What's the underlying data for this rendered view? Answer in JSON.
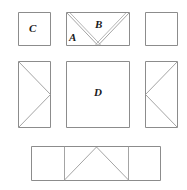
{
  "figure": {
    "type": "geometric-dissection-diagram",
    "background_color": "#ffffff",
    "stroke_color": "#8c8c8c",
    "label_color": "#1a1a1a",
    "labels": [
      {
        "id": "label-a",
        "text": "A",
        "x": 69,
        "y": 32
      },
      {
        "id": "label-b",
        "text": "B",
        "x": 95,
        "y": 19
      },
      {
        "id": "label-c",
        "text": "C",
        "x": 29,
        "y": 23
      },
      {
        "id": "label-d",
        "text": "D",
        "x": 94,
        "y": 87
      }
    ],
    "pieces": [
      {
        "name": "top-left-square",
        "label": "C",
        "x": 18,
        "y": 12,
        "width": 33,
        "height": 34,
        "interior_lines": "none"
      },
      {
        "name": "top-middle-rectangle",
        "labels": [
          "A",
          "B"
        ],
        "x": 66,
        "y": 12,
        "width": 64,
        "height": 34,
        "interior_lines": "double-chevron-v-from-top-corners-to-bottom-center"
      },
      {
        "name": "top-right-square",
        "label": "",
        "x": 145,
        "y": 12,
        "width": 33,
        "height": 34,
        "interior_lines": "none"
      },
      {
        "name": "middle-left-rectangle",
        "label": "",
        "x": 18,
        "y": 61,
        "width": 33,
        "height": 67,
        "interior_lines": "diagonals-from-left-corners-to-right-midpoint"
      },
      {
        "name": "center-square",
        "label": "D",
        "x": 66,
        "y": 61,
        "width": 64,
        "height": 67,
        "interior_lines": "none"
      },
      {
        "name": "middle-right-rectangle",
        "label": "",
        "x": 145,
        "y": 61,
        "width": 33,
        "height": 67,
        "interior_lines": "diagonals-from-right-corners-to-left-midpoint"
      },
      {
        "name": "bottom-strip-left-cell",
        "label": "",
        "x": 31,
        "y": 146,
        "width": 33,
        "height": 35,
        "interior_lines": "none"
      },
      {
        "name": "bottom-strip-middle-cell",
        "label": "",
        "x": 64,
        "y": 146,
        "width": 64,
        "height": 35,
        "interior_lines": "triangle-apex-at-top-center"
      },
      {
        "name": "bottom-strip-right-cell",
        "label": "",
        "x": 128,
        "y": 146,
        "width": 33,
        "height": 35,
        "interior_lines": "none"
      }
    ]
  }
}
